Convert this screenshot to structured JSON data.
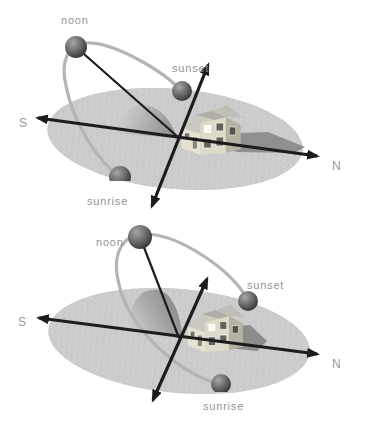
{
  "figure": {
    "colors": {
      "background": "#ffffff",
      "ground": "#cbcbcb",
      "sun_sphere": "#4a4a4a",
      "sun_path_arc": "#b4b4b4",
      "axis": "#1c1c1c",
      "label_text": "#949494",
      "house_shadow": "#8f8f8f",
      "house_wall": "#ded9c8",
      "house_roof": "#bfbfb8",
      "dome_shade_dark": "#8a8a8a",
      "dome_shade_light": "#d6d6d6"
    },
    "diagrams": [
      {
        "name": "low-sun-path",
        "labels": {
          "noon": "noon",
          "sunset": "sunset",
          "sunrise": "sunrise",
          "south": "S",
          "north": "N"
        }
      },
      {
        "name": "high-sun-path",
        "labels": {
          "noon": "noon",
          "sunset": "sunset",
          "sunrise": "sunrise",
          "south": "S",
          "north": "N"
        }
      }
    ]
  }
}
